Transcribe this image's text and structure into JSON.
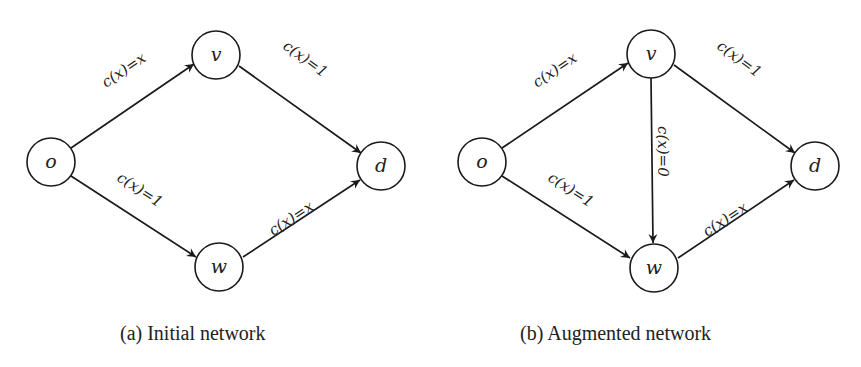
{
  "figure": {
    "panels": [
      {
        "id": "a",
        "caption": "(a) Initial network",
        "nodes": [
          {
            "id": "o",
            "label": "o"
          },
          {
            "id": "v",
            "label": "v"
          },
          {
            "id": "w",
            "label": "w"
          },
          {
            "id": "d",
            "label": "d"
          }
        ],
        "edges": [
          {
            "from": "o",
            "to": "v",
            "label": "c(x)=x"
          },
          {
            "from": "v",
            "to": "d",
            "label": "c(x)=1"
          },
          {
            "from": "o",
            "to": "w",
            "label": "c(x)=1"
          },
          {
            "from": "w",
            "to": "d",
            "label": "c(x)=x"
          }
        ]
      },
      {
        "id": "b",
        "caption": "(b) Augmented network",
        "nodes": [
          {
            "id": "o",
            "label": "o"
          },
          {
            "id": "v",
            "label": "v"
          },
          {
            "id": "w",
            "label": "w"
          },
          {
            "id": "d",
            "label": "d"
          }
        ],
        "edges": [
          {
            "from": "o",
            "to": "v",
            "label": "c(x)=x"
          },
          {
            "from": "v",
            "to": "d",
            "label": "c(x)=1"
          },
          {
            "from": "v",
            "to": "w",
            "label": "c(x)=0"
          },
          {
            "from": "o",
            "to": "w",
            "label": "c(x)=1"
          },
          {
            "from": "w",
            "to": "d",
            "label": "c(x)=x"
          }
        ]
      }
    ]
  }
}
